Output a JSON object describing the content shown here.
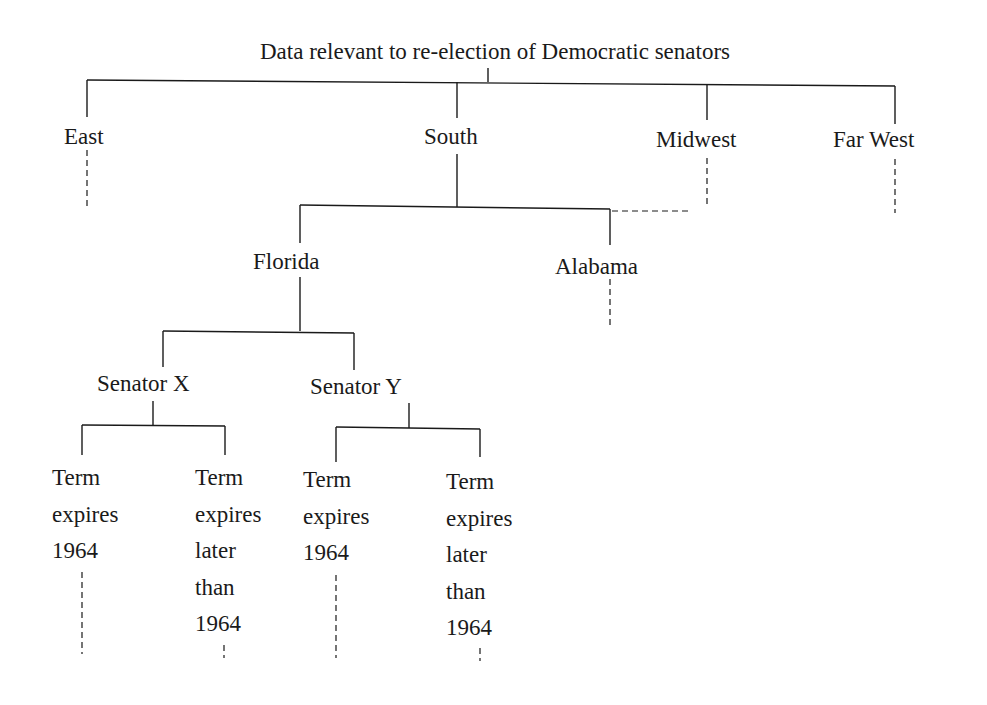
{
  "diagram": {
    "type": "tree",
    "root": {
      "label": "Data relevant to re-election of Democratic senators",
      "regions": [
        {
          "label": "East",
          "expanded": false
        },
        {
          "label": "South",
          "expanded": true
        },
        {
          "label": "Midwest",
          "expanded": false
        },
        {
          "label": "Far West",
          "expanded": false
        }
      ]
    },
    "south_states": [
      {
        "label": "Florida",
        "expanded": true
      },
      {
        "label": "Alabama",
        "expanded": false
      }
    ],
    "florida_senators": [
      {
        "label": "Senator X"
      },
      {
        "label": "Senator Y"
      }
    ],
    "leaves": [
      {
        "lines": [
          "Term",
          "expires",
          "1964"
        ]
      },
      {
        "lines": [
          "Term",
          "expires",
          "later",
          "than",
          "1964"
        ]
      },
      {
        "lines": [
          "Term",
          "expires",
          "1964"
        ]
      },
      {
        "lines": [
          "Term",
          "expires",
          "later",
          "than",
          "1964"
        ]
      }
    ],
    "colors": {
      "line": "#1a1a1a",
      "background": "#ffffff"
    }
  }
}
